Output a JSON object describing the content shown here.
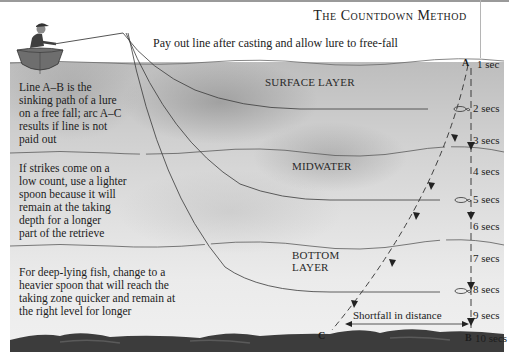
{
  "title": "The Countdown Method",
  "subtitle": "Pay out line after casting and allow lure to free-fall",
  "layers": [
    {
      "name": "surface",
      "label": "SURFACE LAYER"
    },
    {
      "name": "midwater",
      "label": "MIDWATER"
    },
    {
      "name": "bottom",
      "label_line1": "BOTTOM",
      "label_line2": "LAYER"
    }
  ],
  "notes": [
    {
      "id": "sinking-path",
      "lines": [
        "Line A–B is the",
        "sinking path of a lure",
        "on a free fall; arc A–C",
        "results if line is not",
        "paid out"
      ]
    },
    {
      "id": "lighter-spoon",
      "lines": [
        "If strikes come on a",
        "low count, use a lighter",
        "spoon because it will",
        "remain at the taking",
        "depth for a longer",
        "part of the retrieve"
      ]
    },
    {
      "id": "heavier-spoon",
      "lines": [
        "For deep-lying fish, change to a",
        "heavier spoon that will reach the",
        "taking zone quicker and remain at",
        "the right level for longer"
      ]
    }
  ],
  "points": {
    "a": "A",
    "b": "B",
    "c": "C"
  },
  "countdown": [
    "1 sec",
    "2 secs",
    "3 secs",
    "4 secs",
    "5 secs",
    "6 secs",
    "7 secs",
    "8 secs",
    "9 secs",
    "10 secs"
  ],
  "shortfall_label": "Shortfall in distance",
  "icons": [
    "angler-in-boat-icon",
    "spoon-lure-icon",
    "arrow-down-icon"
  ],
  "colors": {
    "water_top": "#bdbdbd",
    "water_bottom": "#f0f0f0",
    "line": "#3a3a3a",
    "seabed": "#3c3c3c"
  }
}
